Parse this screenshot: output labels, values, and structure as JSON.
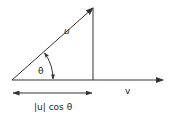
{
  "diagram": {
    "labels": {
      "u": "u",
      "v": "v",
      "theta": "θ",
      "projection": "|u| cos θ"
    },
    "colors": {
      "stroke": "#333333",
      "text": "#222222",
      "background": "#ffffff"
    },
    "geometry": {
      "origin": [
        12,
        80
      ],
      "u_tip": [
        93,
        8
      ],
      "v_tip": [
        163,
        80
      ],
      "foot": [
        93,
        80
      ],
      "projection_arrow_y": 93
    }
  }
}
